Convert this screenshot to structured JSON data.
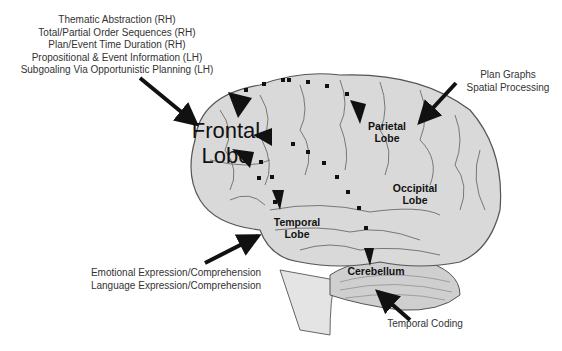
{
  "diagram": {
    "lobes": {
      "frontal": [
        "Frontal",
        "Lobe"
      ],
      "parietal": [
        "Parietal",
        "Lobe"
      ],
      "occipital": [
        "Occipital",
        "Lobe"
      ],
      "temporal": [
        "Temporal",
        "Lobe"
      ],
      "cerebellum": "Cerebellum"
    },
    "annotations": {
      "frontal_functions": [
        "Thematic Abstraction (RH)",
        "Total/Partial Order Sequences (RH)",
        "Plan/Event Time Duration (RH)",
        "Propositional & Event Information (LH)",
        "Subgoaling Via Opportunistic Planning  (LH)"
      ],
      "parietal_functions": [
        "Plan Graphs",
        "Spatial Processing"
      ],
      "temporal_functions": [
        "Emotional Expression/Comprehension",
        "Language Expression/Comprehension"
      ],
      "cerebellum_functions": [
        "Temporal Coding"
      ]
    },
    "colors": {
      "brain_fill": "#d9d9d9",
      "brain_stroke": "#555555",
      "arrow": "#111111",
      "text": "#333333"
    }
  }
}
